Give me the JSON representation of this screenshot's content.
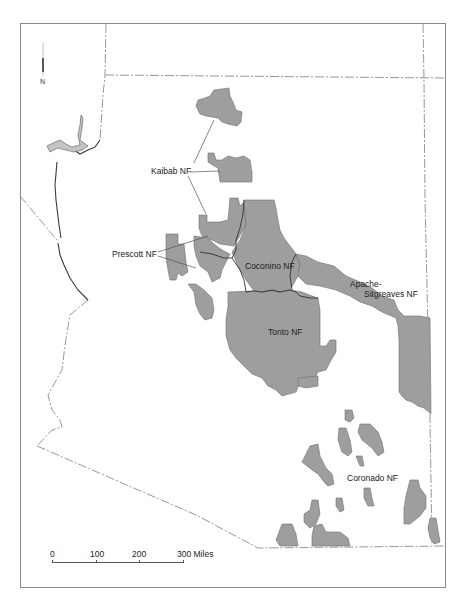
{
  "map": {
    "subject": "National Forests of Arizona",
    "fill_color": "#9e9e9e",
    "border_color": "#8c8c8c",
    "north_arrow": {
      "label": "N"
    },
    "forests": [
      {
        "name": "Kaibab NF"
      },
      {
        "name": "Prescott NF"
      },
      {
        "name": "Coconino NF"
      },
      {
        "name": "Apache-\nSitgreaves NF",
        "line1": "Apache-",
        "line2": "Sitgreaves NF"
      },
      {
        "name": "Tonto NF"
      },
      {
        "name": "Coronado NF"
      }
    ],
    "scale_bar": {
      "ticks": [
        "0",
        "100",
        "200",
        "300 Miles"
      ],
      "unit": "Miles"
    }
  }
}
